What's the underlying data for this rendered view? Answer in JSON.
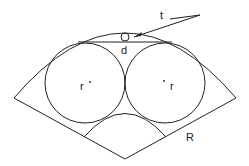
{
  "labels": {
    "t": "t",
    "d": "d",
    "r_left": "r",
    "r_right": "r",
    "R": "R"
  },
  "colors": {
    "stroke": "#222222",
    "background": "#ffffff"
  }
}
